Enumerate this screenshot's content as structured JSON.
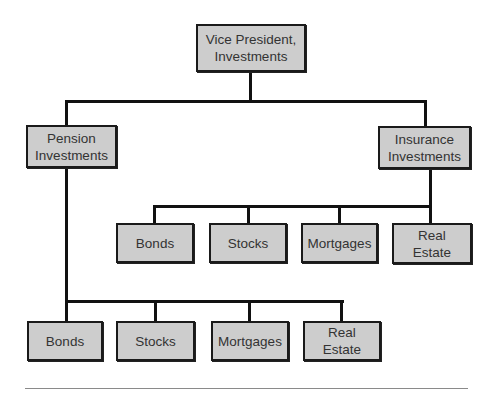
{
  "diagram": {
    "type": "org-chart",
    "root": {
      "label": "Vice President,\nInvestments"
    },
    "divisions": [
      {
        "label": "Pension\nInvestments",
        "children": [
          "Bonds",
          "Stocks",
          "Mortgages",
          "Real\nEstate"
        ]
      },
      {
        "label": "Insurance\nInvestments",
        "children": [
          "Bonds",
          "Stocks",
          "Mortgages",
          "Real\nEstate"
        ]
      }
    ]
  },
  "colors": {
    "box_fill": "#cdcdcd",
    "box_border": "#1a1a1a",
    "text": "#333333",
    "connector": "#111111",
    "rule": "#8a8a8a"
  }
}
